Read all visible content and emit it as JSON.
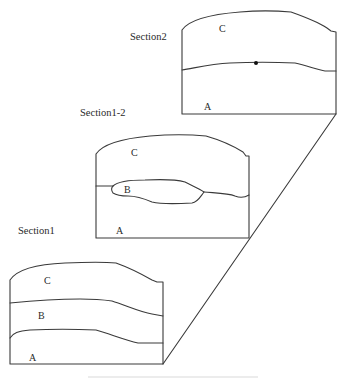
{
  "diagram": {
    "sections": [
      {
        "id": "section2",
        "label": "Section2",
        "layers": {
          "top": "C",
          "bottom": "A"
        },
        "marker": "dot"
      },
      {
        "id": "section1-2",
        "label": "Section1-2",
        "layers": {
          "top": "C",
          "lens": "B",
          "bottom": "A"
        }
      },
      {
        "id": "section1",
        "label": "Section1",
        "layers": {
          "top": "C",
          "middle": "B",
          "bottom": "A"
        }
      }
    ],
    "connector": "diagonal-perspective-line",
    "colors": {
      "line": "#3a3a3a",
      "text": "#2a2a2a",
      "background": "#ffffff"
    }
  }
}
